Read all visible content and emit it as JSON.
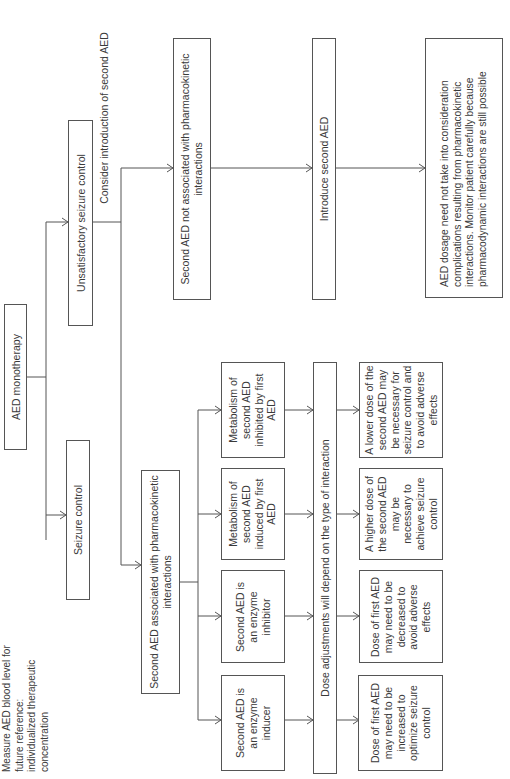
{
  "diagram": {
    "orientation": "rotated-90-ccw",
    "root": {
      "label": "AED monotherapy"
    },
    "branch_control": {
      "label": "Seizure control",
      "note": "Measure AED blood level for future reference: individualized therapeutic concentration"
    },
    "branch_uncontrolled": {
      "label": "Unsatisfactory seizure control",
      "edge_label": "Consider introduction of second AED"
    },
    "no_pk": {
      "label": "Second AED not associated with pharmacokinetic interactions",
      "next": "Introduce second AED",
      "outcome": "AED dosage need not take into consideration complications resulting from pharmacokinetic interactions.  Monitor patient carefully because pharmacodynamic interactions are still possible"
    },
    "pk": {
      "label": "Second AED associated with pharmacokinetic interactions",
      "types": [
        "Second AED is an enzyme inducer",
        "Second AED is an enzyme inhibitor",
        "Metabolism of second AED induced by first AED",
        "Metabolism of second AED inhibited by first AED"
      ],
      "adjustment_bar": "Dose adjustments will depend on the type of  interaction",
      "outcomes": [
        "Dose of first AED may need to be increased to optimize seizure control",
        "Dose of first AED may need to be decreased to avoid adverse effects",
        "A higher dose of the second AED may be necessary to achieve seizure control",
        "A lower dose of the second AED may be necessary for seizure control and to avoid adverse effects"
      ]
    },
    "colors": {
      "line": "#555555",
      "text": "#3a3a3a",
      "background": "#ffffff"
    }
  }
}
